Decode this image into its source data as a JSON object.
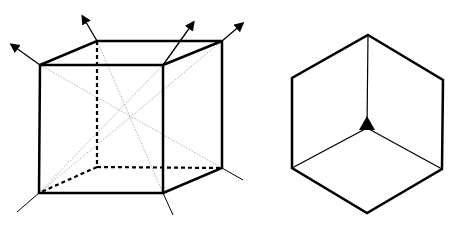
{
  "figure": {
    "colors": {
      "edge": "#000000",
      "diagonal": "#9a9a9a",
      "background": "#ffffff"
    },
    "left_cube": {
      "front_face": [
        [
          40,
          65
        ],
        [
          163,
          65
        ],
        [
          163,
          193
        ],
        [
          39,
          193
        ]
      ],
      "back_top_left": [
        97,
        41
      ],
      "back_top_right": [
        222,
        41
      ],
      "back_bottom_right": [
        222,
        168
      ],
      "back_bottom_left_hidden": [
        97,
        167
      ],
      "center": [
        130,
        117
      ],
      "arrows": [
        {
          "from": [
            40,
            65
          ],
          "to": [
            9,
            43
          ]
        },
        {
          "from": [
            97,
            41
          ],
          "to": [
            80,
            14
          ]
        },
        {
          "from": [
            163,
            65
          ],
          "to": [
            196,
            19
          ]
        },
        {
          "from": [
            222,
            41
          ],
          "to": [
            245,
            22
          ]
        }
      ],
      "tails": [
        {
          "from": [
            39,
            193
          ],
          "to": [
            17,
            212
          ]
        },
        {
          "from": [
            163,
            193
          ],
          "to": [
            173,
            215
          ]
        },
        {
          "from": [
            222,
            168
          ],
          "to": [
            243,
            180
          ]
        }
      ]
    },
    "right_hexagon": {
      "vertices": [
        [
          368,
          35
        ],
        [
          443,
          80
        ],
        [
          442,
          169
        ],
        [
          367,
          213
        ],
        [
          292,
          168
        ],
        [
          292,
          78
        ]
      ],
      "center": [
        367,
        128
      ],
      "threefold_symbol": [
        [
          367,
          116
        ],
        [
          359,
          130
        ],
        [
          375,
          130
        ]
      ]
    }
  }
}
